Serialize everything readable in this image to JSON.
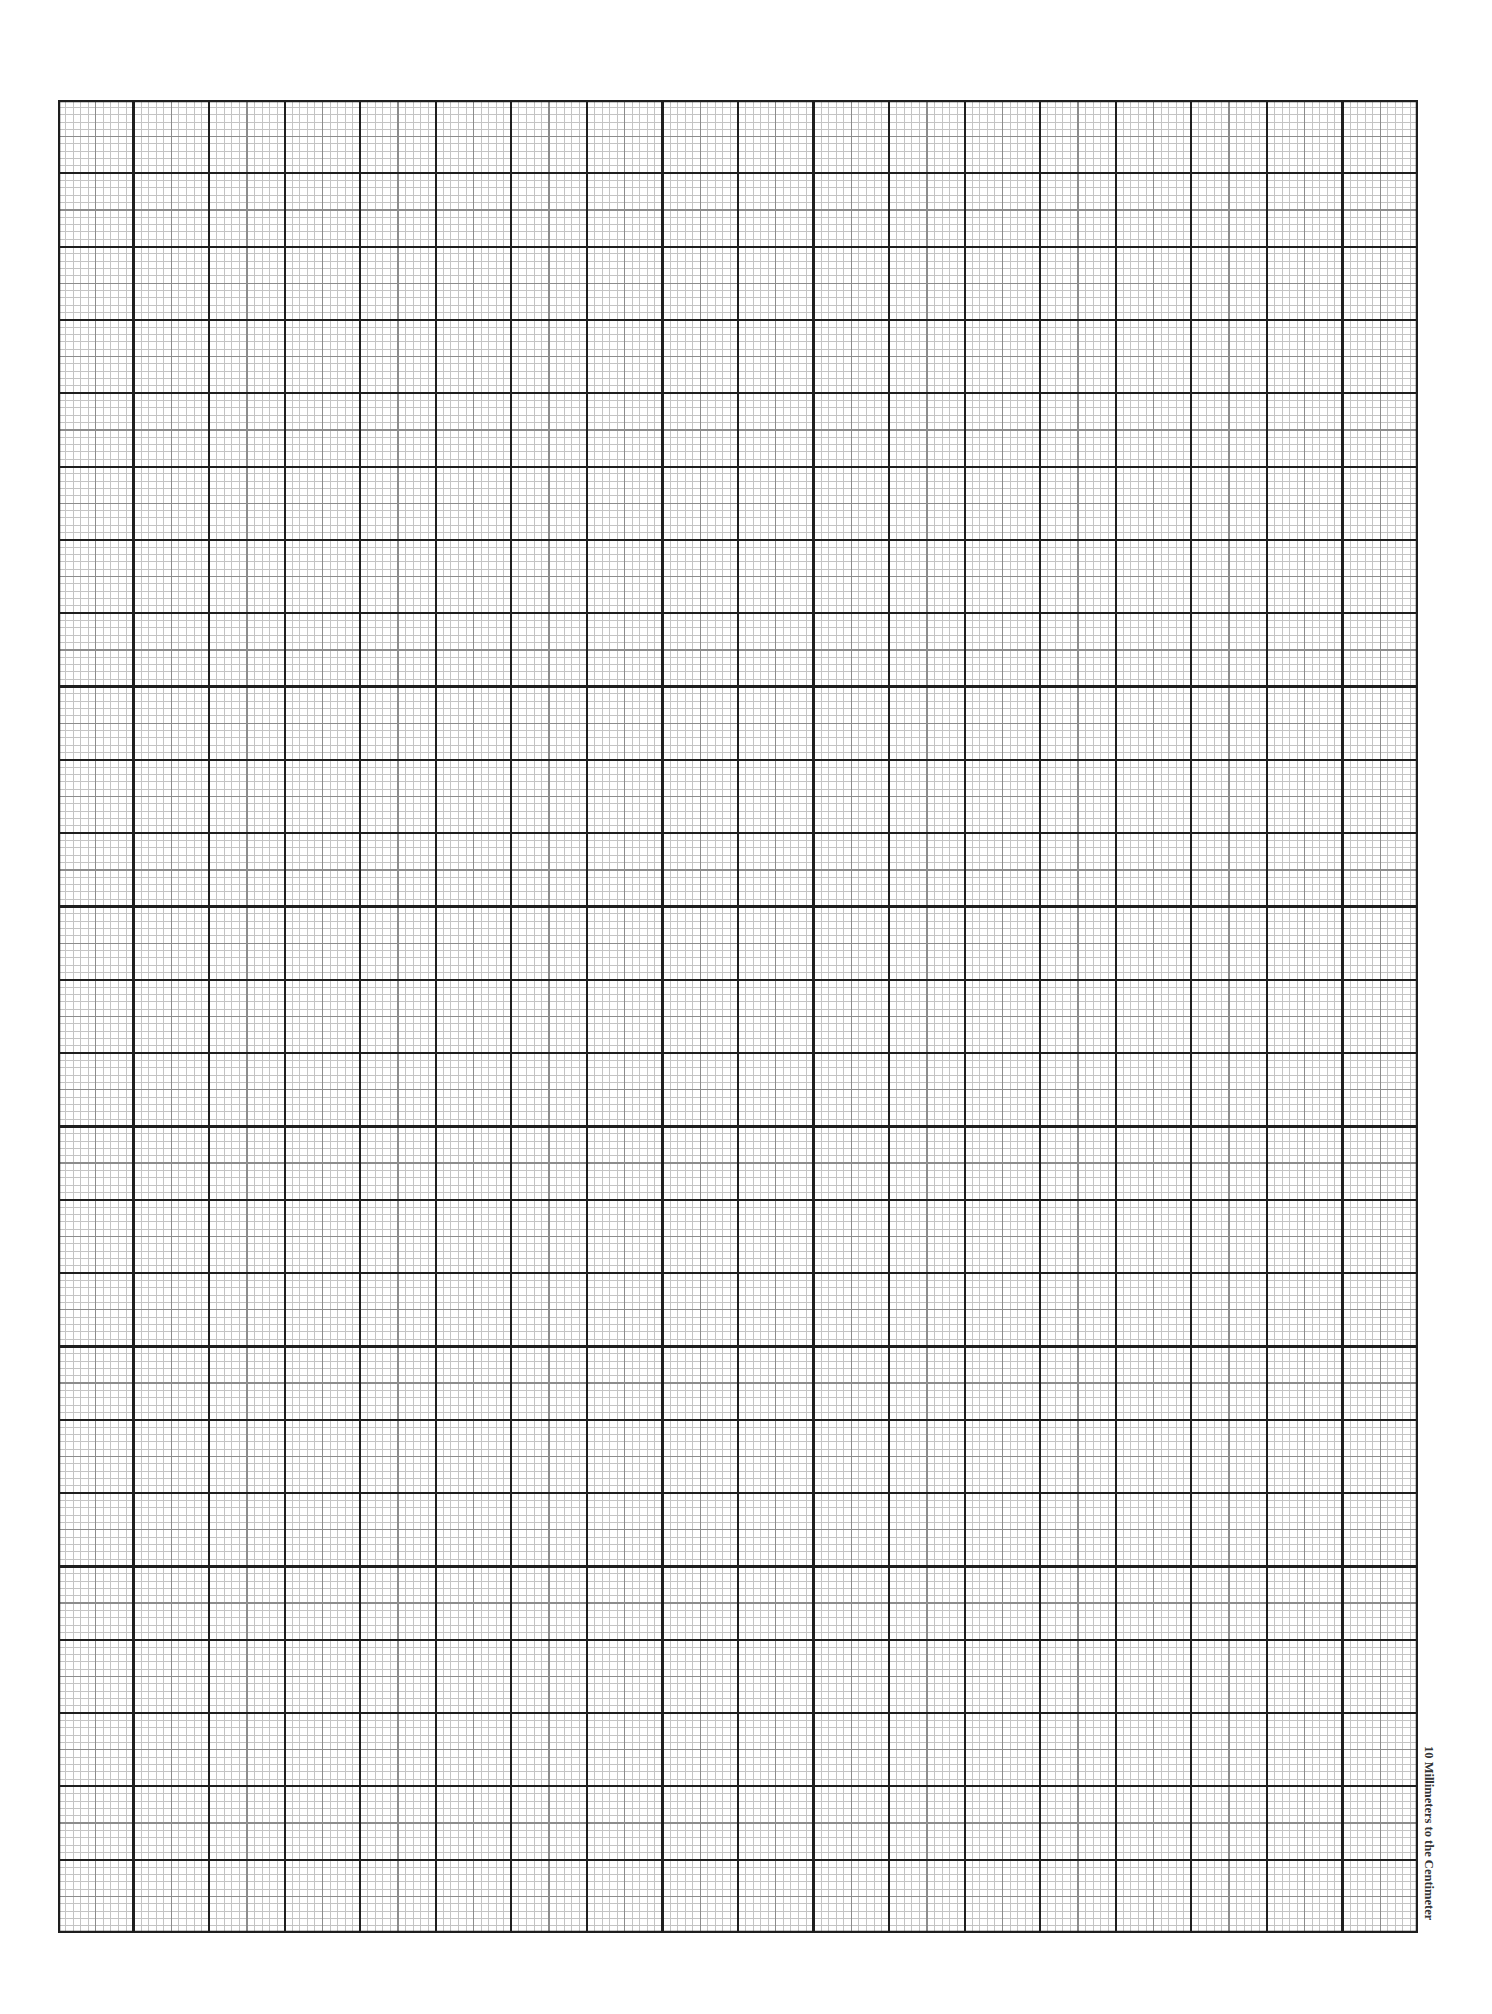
{
  "document": {
    "type": "graph-paper",
    "label": "10 Millimeters to the Centimeter"
  },
  "grid": {
    "major_columns": 18,
    "major_rows": 25,
    "subdivisions_per_major": 10,
    "mid_line_every": 5,
    "colors": {
      "minor": "#c4c4c4",
      "mid": "#8c8c8c",
      "major": "#1e1e1e",
      "paper": "#ffffff"
    }
  }
}
